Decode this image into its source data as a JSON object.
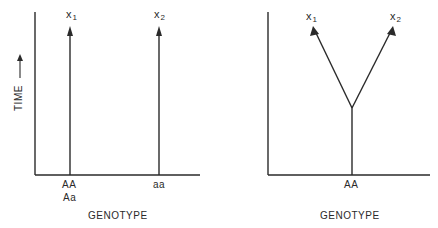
{
  "panels": [
    {
      "id": "left",
      "y_axis_label": "TIME",
      "x_axis_label": "GENOTYPE",
      "genotypes": [
        {
          "labels": [
            "AA",
            "Aa"
          ],
          "outcome": {
            "var": "x",
            "sub": "1"
          }
        },
        {
          "labels": [
            "aa"
          ],
          "outcome": {
            "var": "x",
            "sub": "2"
          }
        }
      ]
    },
    {
      "id": "right",
      "x_axis_label": "GENOTYPE",
      "genotypes": [
        {
          "labels": [
            "AA"
          ],
          "branches": [
            {
              "var": "x",
              "sub": "1"
            },
            {
              "var": "x",
              "sub": "2"
            }
          ]
        }
      ]
    }
  ],
  "colors": {
    "ink": "#2a2a2a",
    "background": "#ffffff"
  }
}
